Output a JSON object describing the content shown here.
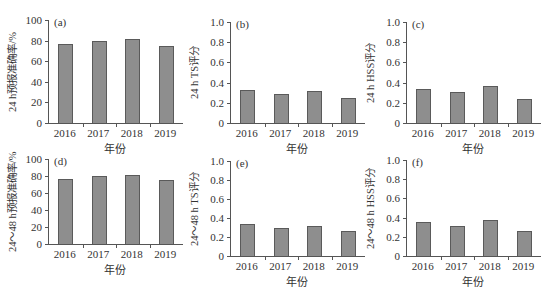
{
  "chart_data": [
    {
      "id": "a",
      "type": "bar",
      "panel_label": "(a)",
      "categories": [
        "2016",
        "2017",
        "2018",
        "2019"
      ],
      "values": [
        77,
        80,
        81.5,
        75
      ],
      "xlabel": "年份",
      "ylabel": "24 h预报准确率/%",
      "ylim": [
        0,
        100
      ],
      "yticks": [
        "0",
        "20",
        "40",
        "60",
        "80",
        "100"
      ],
      "grid": false,
      "bar_color": "#8e8e8e"
    },
    {
      "id": "b",
      "type": "bar",
      "panel_label": "(b)",
      "categories": [
        "2016",
        "2017",
        "2018",
        "2019"
      ],
      "values": [
        0.33,
        0.29,
        0.32,
        0.25
      ],
      "xlabel": "年份",
      "ylabel": "24 h TS评分",
      "ylim": [
        0,
        1.0
      ],
      "yticks": [
        "0",
        "0.2",
        "0.4",
        "0.6",
        "0.8",
        "1.0"
      ],
      "grid": false,
      "bar_color": "#8e8e8e"
    },
    {
      "id": "c",
      "type": "bar",
      "panel_label": "(c)",
      "categories": [
        "2016",
        "2017",
        "2018",
        "2019"
      ],
      "values": [
        0.34,
        0.31,
        0.37,
        0.24
      ],
      "xlabel": "年份",
      "ylabel": "24 h HSS评分",
      "ylim": [
        0,
        1.0
      ],
      "yticks": [
        "0",
        "0.2",
        "0.4",
        "0.6",
        "0.8",
        "1.0"
      ],
      "grid": false,
      "bar_color": "#8e8e8e"
    },
    {
      "id": "d",
      "type": "bar",
      "panel_label": "(d)",
      "categories": [
        "2016",
        "2017",
        "2018",
        "2019"
      ],
      "values": [
        76,
        80.5,
        81.5,
        75.5
      ],
      "xlabel": "年份",
      "ylabel": "24～48 h预报准确率/%",
      "ylim": [
        0,
        100
      ],
      "yticks": [
        "0",
        "20",
        "40",
        "60",
        "80",
        "100"
      ],
      "grid": false,
      "bar_color": "#8e8e8e"
    },
    {
      "id": "e",
      "type": "bar",
      "panel_label": "(e)",
      "categories": [
        "2016",
        "2017",
        "2018",
        "2019"
      ],
      "values": [
        0.34,
        0.29,
        0.32,
        0.26
      ],
      "xlabel": "年份",
      "ylabel": "24～48 h TS评分",
      "ylim": [
        0,
        1.0
      ],
      "yticks": [
        "0",
        "0.2",
        "0.4",
        "0.6",
        "0.8",
        "1.0"
      ],
      "grid": false,
      "bar_color": "#8e8e8e"
    },
    {
      "id": "f",
      "type": "bar",
      "panel_label": "(f)",
      "categories": [
        "2016",
        "2017",
        "2018",
        "2019"
      ],
      "values": [
        0.35,
        0.31,
        0.37,
        0.26
      ],
      "xlabel": "年份",
      "ylabel": "24～48 h HSS评分",
      "ylim": [
        0,
        1.0
      ],
      "yticks": [
        "0",
        "0.2",
        "0.4",
        "0.6",
        "0.8",
        "1.0"
      ],
      "grid": false,
      "bar_color": "#8e8e8e"
    }
  ]
}
